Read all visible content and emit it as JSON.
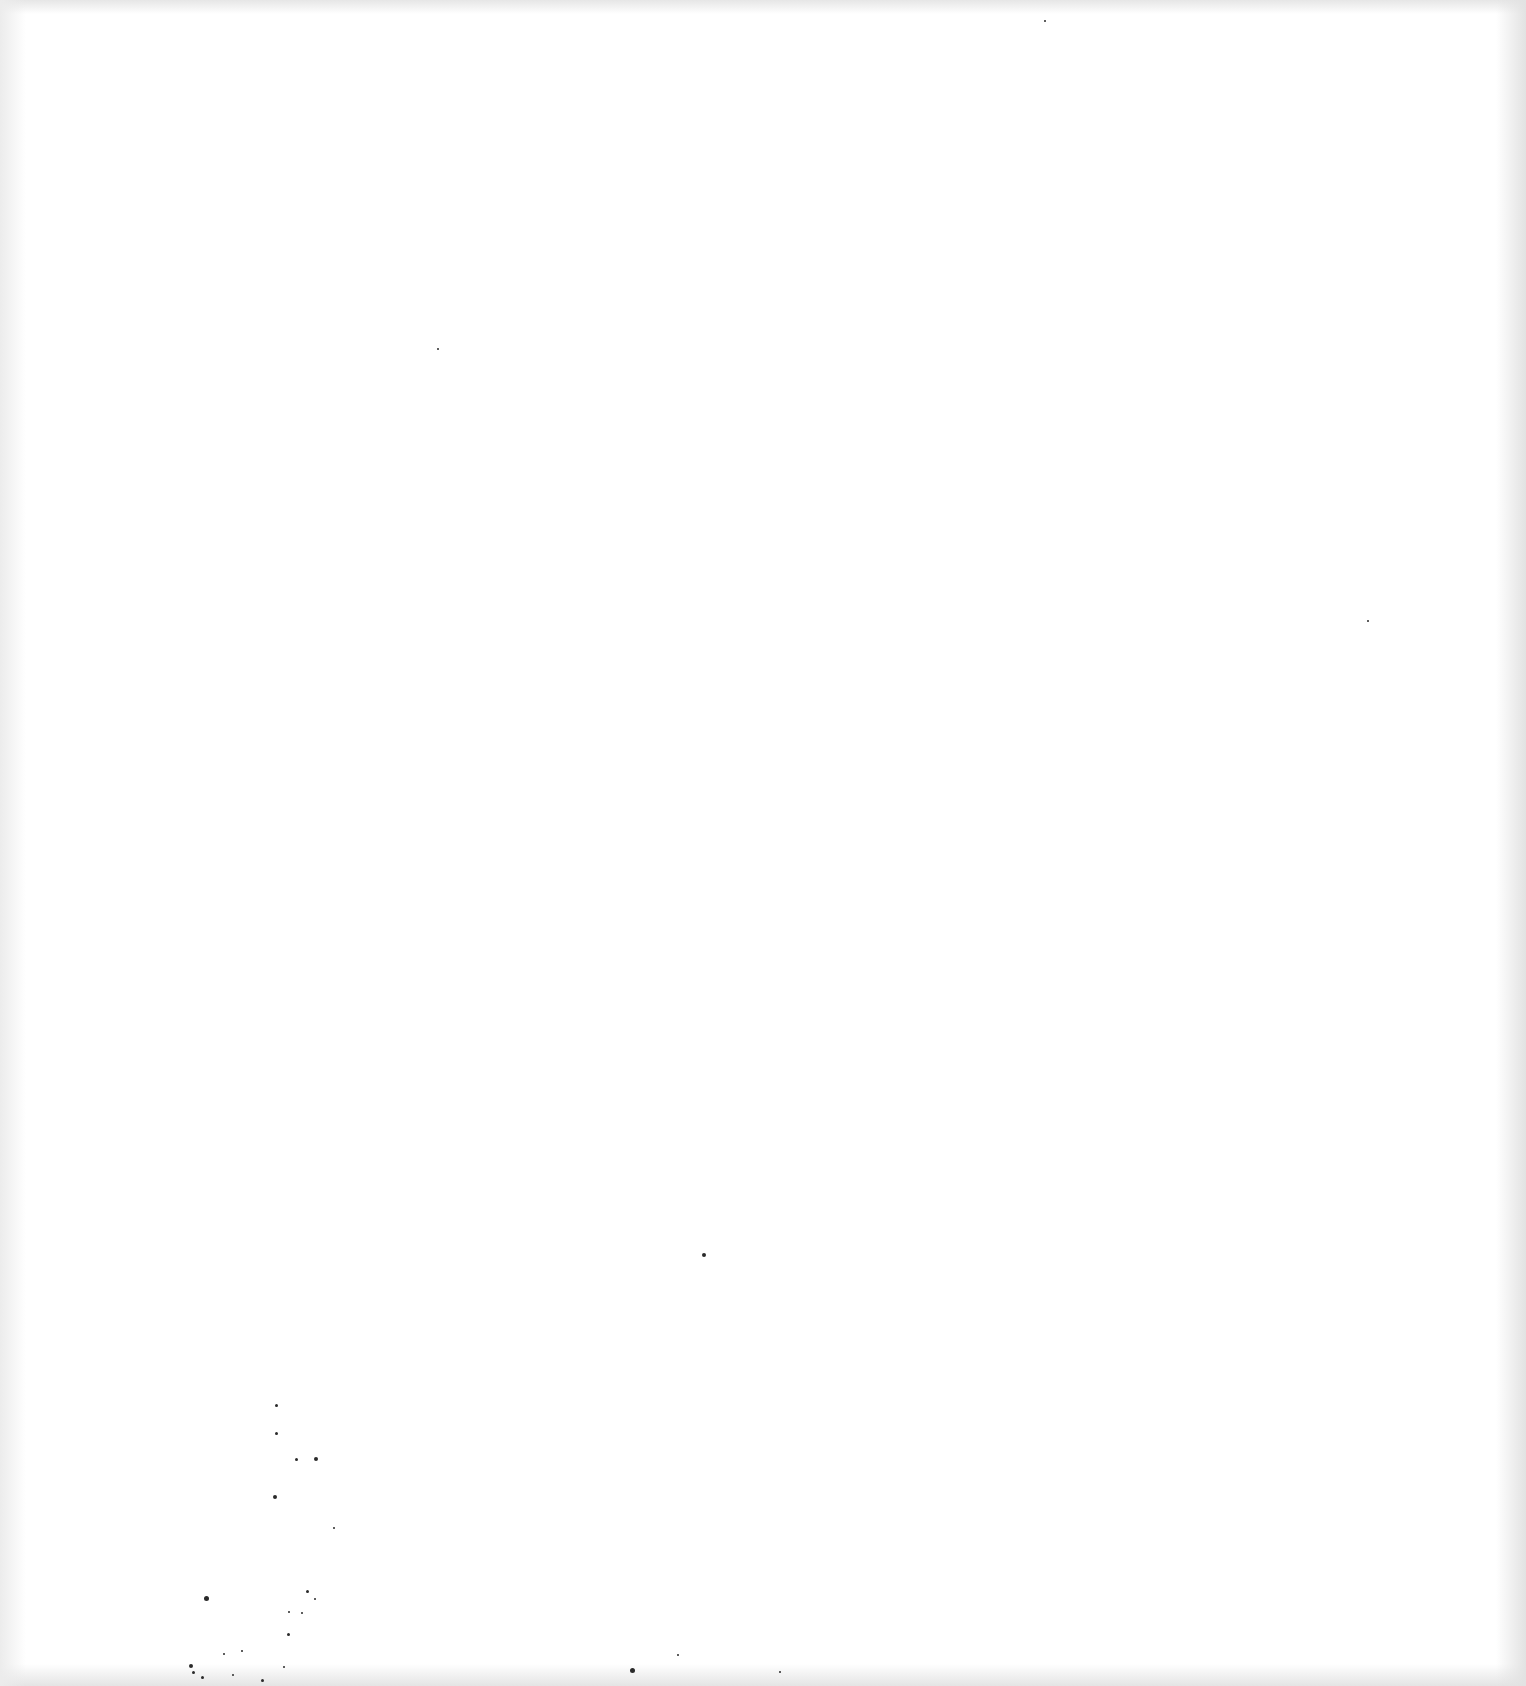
{
  "page": {
    "type": "blank scanned sheet",
    "background_color": "#ffffff",
    "edge_shade_color": "#e4e4e4",
    "speck_color": "#2a2a2a"
  },
  "specks": [
    {
      "x": 276,
      "y": 1405,
      "r": 1.5
    },
    {
      "x": 276,
      "y": 1433,
      "r": 1.5
    },
    {
      "x": 296,
      "y": 1459,
      "r": 1.5
    },
    {
      "x": 316,
      "y": 1459,
      "r": 2
    },
    {
      "x": 275,
      "y": 1497,
      "r": 2
    },
    {
      "x": 334,
      "y": 1528,
      "r": 1.2
    },
    {
      "x": 315,
      "y": 1599,
      "r": 1.2
    },
    {
      "x": 307,
      "y": 1591,
      "r": 1.5
    },
    {
      "x": 302,
      "y": 1613,
      "r": 1.2
    },
    {
      "x": 289,
      "y": 1612,
      "r": 1.2
    },
    {
      "x": 288,
      "y": 1634,
      "r": 1.5
    },
    {
      "x": 206,
      "y": 1598,
      "r": 2.5
    },
    {
      "x": 224,
      "y": 1654,
      "r": 1.2
    },
    {
      "x": 242,
      "y": 1651,
      "r": 1.2
    },
    {
      "x": 191,
      "y": 1666,
      "r": 2
    },
    {
      "x": 193,
      "y": 1672,
      "r": 1.5
    },
    {
      "x": 202,
      "y": 1677,
      "r": 1.5
    },
    {
      "x": 233,
      "y": 1675,
      "r": 1.2
    },
    {
      "x": 262,
      "y": 1680,
      "r": 1.5
    },
    {
      "x": 284,
      "y": 1667,
      "r": 1.2
    },
    {
      "x": 632,
      "y": 1670,
      "r": 2.5
    },
    {
      "x": 678,
      "y": 1655,
      "r": 1.2
    },
    {
      "x": 780,
      "y": 1672,
      "r": 1.2
    },
    {
      "x": 704,
      "y": 1255,
      "r": 2
    },
    {
      "x": 438,
      "y": 349,
      "r": 1
    },
    {
      "x": 1045,
      "y": 21,
      "r": 1
    },
    {
      "x": 1368,
      "y": 621,
      "r": 1
    }
  ]
}
